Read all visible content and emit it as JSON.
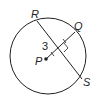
{
  "diagram": {
    "type": "circle-geometry",
    "center_label": "P",
    "points": {
      "R": "R",
      "Q": "Q",
      "S": "S",
      "P": "P"
    },
    "distance_label": "3",
    "elements": [
      "circle centered at P",
      "chord RS",
      "segment PQ perpendicular to RS",
      "right-angle marker",
      "congruence tick marks"
    ],
    "colors": {
      "stroke": "#222222",
      "background": "#ffffff"
    }
  }
}
